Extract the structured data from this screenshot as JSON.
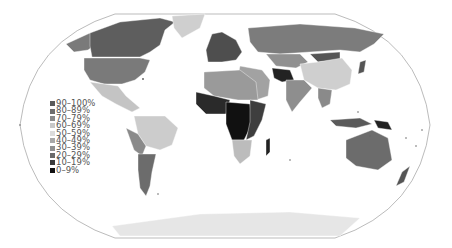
{
  "map": {
    "projection": "robinson-like",
    "style": "grayscale choropleth",
    "background": "#ffffff",
    "outline_color": "#aaaaaa"
  },
  "legend": {
    "items": [
      {
        "label": "90–100%",
        "color": "#5a5a5a"
      },
      {
        "label": "80–89%",
        "color": "#6e6e6e"
      },
      {
        "label": "70–79%",
        "color": "#8a8a8a"
      },
      {
        "label": "60–69%",
        "color": "#c8c8c8"
      },
      {
        "label": "50–59%",
        "color": "#dcdcdc"
      },
      {
        "label": "40–49%",
        "color": "#a8a8a8"
      },
      {
        "label": "30–39%",
        "color": "#909090"
      },
      {
        "label": "20–29%",
        "color": "#6a6a6a"
      },
      {
        "label": "10–19%",
        "color": "#3a3a3a"
      },
      {
        "label": "0–9%",
        "color": "#111111"
      }
    ]
  },
  "regions": {
    "canada": "#5e5e5e",
    "usa": "#7a7a7a",
    "alaska": "#7a7a7a",
    "greenland": "#cfcfcf",
    "mexico_central_america": "#c4c4c4",
    "south_america_north": "#cccccc",
    "south_america_west": "#8a8a8a",
    "argentina_chile": "#6c6c6c",
    "europe": "#4e4e4e",
    "russia": "#7c7c7c",
    "central_asia": "#909090",
    "mongolia": "#555555",
    "china": "#cfcfcf",
    "india": "#8e8e8e",
    "middle_east": "#a2a2a2",
    "iran_afghanistan": "#222222",
    "southeast_asia": "#8a8a8a",
    "north_africa": "#9a9a9a",
    "west_africa": "#2a2a2a",
    "central_africa": "#111111",
    "east_africa": "#3e3e3e",
    "southern_africa": "#bcbcbc",
    "madagascar": "#222222",
    "australia": "#6c6c6c",
    "new_zealand": "#555555",
    "indonesia": "#5a5a5a",
    "papua": "#222222",
    "antarctica": "#e6e6e6",
    "japan": "#555555"
  }
}
